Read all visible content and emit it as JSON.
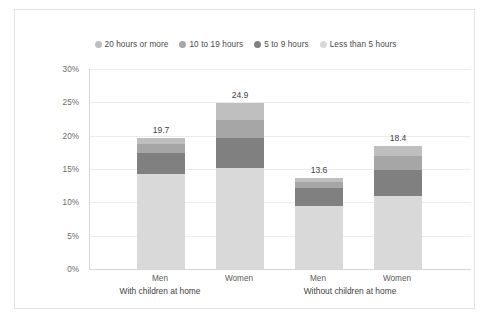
{
  "chart_data": {
    "type": "bar",
    "subtype": "stacked-column",
    "title": "",
    "xlabel": "",
    "ylabel": "",
    "ylim": [
      0,
      30
    ],
    "ytick_labels": [
      "0%",
      "5%",
      "10%",
      "15%",
      "20%",
      "25%",
      "30%"
    ],
    "ytick_values": [
      0,
      5,
      10,
      15,
      20,
      25,
      30
    ],
    "grid": true,
    "legend_position": "top",
    "categories": [
      "Men",
      "Women",
      "Men",
      "Women"
    ],
    "groups": [
      {
        "label": "With children at home",
        "categories": [
          "Men",
          "Women"
        ]
      },
      {
        "label": "Without children at home",
        "categories": [
          "Men",
          "Women"
        ]
      }
    ],
    "series": [
      {
        "name": "Less than 5 hours",
        "color": "#d9d9d9",
        "values": [
          14.3,
          15.1,
          9.4,
          10.9
        ]
      },
      {
        "name": "5 to 9 hours",
        "color": "#808080",
        "values": [
          3.1,
          4.6,
          2.7,
          4.0
        ]
      },
      {
        "name": "10 to 19 hours",
        "color": "#a6a6a6",
        "values": [
          1.4,
          2.7,
          0.9,
          2.0
        ]
      },
      {
        "name": "20 hours or more",
        "color": "#bfbfbf",
        "values": [
          0.9,
          2.5,
          0.6,
          1.5
        ]
      }
    ],
    "totals": [
      19.7,
      24.9,
      13.6,
      18.4
    ],
    "total_labels": [
      "19.7",
      "24.9",
      "13.6",
      "18.4"
    ]
  },
  "legend": {
    "items": [
      {
        "label": "20 hours or more",
        "color": "#bfbfbf"
      },
      {
        "label": "10 to 19 hours",
        "color": "#a6a6a6"
      },
      {
        "label": "5 to 9 hours",
        "color": "#808080"
      },
      {
        "label": "Less than 5 hours",
        "color": "#d9d9d9"
      }
    ]
  },
  "colors": {
    "frame_border": "#e3e3e3",
    "axis_line": "#d6d6d6",
    "gridline": "#ececec",
    "label_text": "#5a5a5a",
    "value_text": "#3f3f3f",
    "background": "#ffffff"
  }
}
